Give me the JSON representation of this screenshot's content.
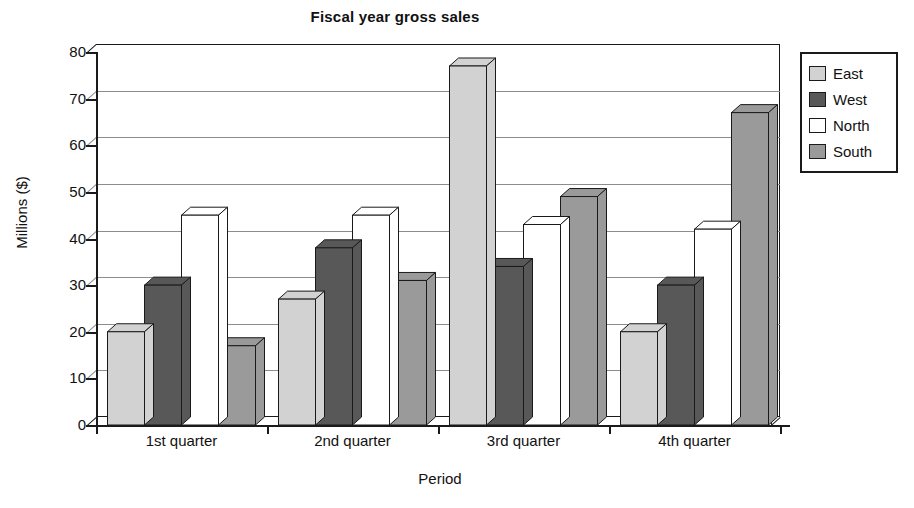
{
  "chart_data": {
    "type": "bar",
    "title": "Fiscal year gross sales",
    "xlabel": "Period",
    "ylabel": "Millions ($)",
    "categories": [
      "1st quarter",
      "2nd quarter",
      "3rd quarter",
      "4th quarter"
    ],
    "series": [
      {
        "name": "East",
        "color": "#d2d2d2",
        "values": [
          20,
          27,
          77,
          20
        ]
      },
      {
        "name": "West",
        "color": "#585858",
        "values": [
          30,
          38,
          34,
          30
        ]
      },
      {
        "name": "North",
        "color": "#ffffff",
        "values": [
          45,
          45,
          43,
          42
        ]
      },
      {
        "name": "South",
        "color": "#9a9a9a",
        "values": [
          17,
          31,
          49,
          67
        ]
      }
    ],
    "ylim": [
      0,
      80
    ],
    "yticks": [
      0,
      10,
      20,
      30,
      40,
      50,
      60,
      70,
      80
    ],
    "ytick_labels": [
      "0",
      "10",
      "20",
      "30",
      "40",
      "50",
      "60",
      "70",
      "80"
    ],
    "grid": true,
    "legend_position": "right",
    "style": "3d-columns"
  },
  "legend": {
    "entries": [
      "East",
      "West",
      "North",
      "South"
    ]
  },
  "colors": {
    "east": "#d2d2d2",
    "west": "#585858",
    "north": "#ffffff",
    "south": "#9a9a9a",
    "axis": "#1a1a1a",
    "grid": "#8c8c8c",
    "background": "#ffffff"
  }
}
